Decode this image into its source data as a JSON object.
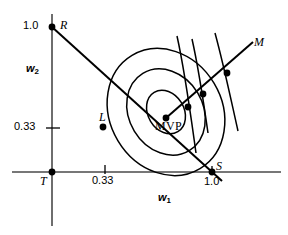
{
  "figure": {
    "background_color": "#ffffff",
    "ink_color": "#000000"
  },
  "axes": {
    "x_label": "w",
    "x_label_sub": "1",
    "y_label": "w",
    "y_label_sub": "2",
    "x_ticks": [
      {
        "label": "0.33",
        "value": 0.33
      },
      {
        "label": "1.0",
        "value": 1.0
      }
    ],
    "y_ticks": [
      {
        "label": "0.33",
        "value": 0.33
      },
      {
        "label": "1.0",
        "value": 1.0
      }
    ]
  },
  "points": [
    {
      "id": "R",
      "label": "R",
      "x": 0.0,
      "y": 1.0
    },
    {
      "id": "T",
      "label": "T",
      "x": 0.0,
      "y": 0.0
    },
    {
      "id": "L",
      "label": "L",
      "x": 0.33,
      "y": 0.33
    },
    {
      "id": "S",
      "label": "S",
      "x": 1.0,
      "y": 0.0
    },
    {
      "id": "MVP",
      "label": "MVP",
      "x": 0.62,
      "y": 0.42
    }
  ],
  "rays": [
    {
      "id": "M",
      "label": "M",
      "from": "MVP",
      "direction": "upper-right"
    },
    {
      "id": "RS",
      "label": "",
      "from": "R",
      "to": "S"
    }
  ],
  "tangency_points": [
    {
      "index": 1,
      "on": "inner-ellipse"
    },
    {
      "index": 2,
      "on": "middle-ellipse"
    },
    {
      "index": 3,
      "on": "outer-ellipse"
    }
  ],
  "ellipses": [
    {
      "index": 1,
      "name": "inner-isovariance-ellipse"
    },
    {
      "index": 2,
      "name": "middle-isovariance-ellipse"
    },
    {
      "index": 3,
      "name": "outer-isovariance-ellipse"
    }
  ],
  "tangent_lines": [
    {
      "index": 1,
      "at_point": 1
    },
    {
      "index": 2,
      "at_point": 2
    },
    {
      "index": 3,
      "at_point": 3
    }
  ]
}
